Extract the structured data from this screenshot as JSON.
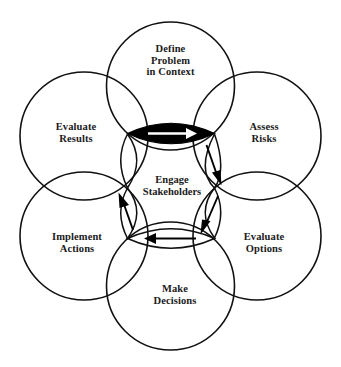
{
  "diagram": {
    "type": "overlapping-circles-cycle",
    "background_color": "#ffffff",
    "stroke_color": "#111111",
    "text_color": "#1a1a1a",
    "highlight_fill": "#000000",
    "center": {
      "name": "engage-stakeholders",
      "line1": "Engage",
      "line2": "Stakeholders"
    },
    "nodes": [
      {
        "name": "define-problem-in-context",
        "position": "top",
        "line1": "Define",
        "line2": "Problem",
        "line3": "in Context"
      },
      {
        "name": "assess-risks",
        "position": "top-right",
        "line1": "Assess",
        "line2": "Risks",
        "line3": ""
      },
      {
        "name": "evaluate-options",
        "position": "bottom-right",
        "line1": "Evaluate",
        "line2": "Options",
        "line3": ""
      },
      {
        "name": "make-decisions",
        "position": "bottom",
        "line1": "Make",
        "line2": "Decisions",
        "line3": ""
      },
      {
        "name": "implement-actions",
        "position": "bottom-left",
        "line1": "Implement",
        "line2": "Actions",
        "line3": ""
      },
      {
        "name": "evaluate-results",
        "position": "top-left",
        "line1": "Evaluate",
        "line2": "Results",
        "line3": ""
      }
    ],
    "arrows": [
      {
        "name": "arrow-define-to-assess",
        "from": "define-problem-in-context",
        "to": "assess-risks",
        "direction": "right",
        "style": "filled-lens-white-arrow"
      },
      {
        "name": "arrow-assess-to-evaluate-options",
        "from": "assess-risks",
        "to": "evaluate-options",
        "direction": "down-right",
        "style": "open-lens-black-arrow"
      },
      {
        "name": "arrow-evaluate-options-to-make-decisions",
        "from": "evaluate-options",
        "to": "make-decisions",
        "direction": "down-left",
        "style": "open-lens-black-arrow"
      },
      {
        "name": "arrow-make-decisions-to-implement-actions",
        "from": "make-decisions",
        "to": "implement-actions",
        "direction": "left",
        "style": "open-lens-black-arrow"
      },
      {
        "name": "arrow-implement-actions-to-evaluate-results",
        "from": "implement-actions",
        "to": "evaluate-results",
        "direction": "up-left",
        "style": "open-lens-black-arrow"
      }
    ]
  }
}
